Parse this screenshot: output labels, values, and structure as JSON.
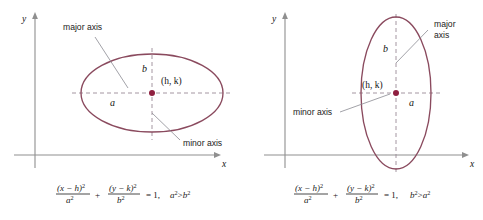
{
  "figure": {
    "stroke_color_curve": "#8a4a5e",
    "color_center_dot": "#8f2040",
    "color_axis": "#8f8f8f",
    "color_dash": "#9a8a96"
  },
  "panels": [
    {
      "id": "horizontal-major-axis",
      "orientation": "horizontal",
      "axis_x_label": "x",
      "axis_y_label": "y",
      "center_label": "(h, k)",
      "semi_axis_horizontal_label": "a",
      "semi_axis_vertical_label": "b",
      "annotation_major": "major axis",
      "annotation_major_line2": "",
      "annotation_minor": "minor axis",
      "annotation_minor_line2": "",
      "equation": {
        "num_left": "(x − h)",
        "num_left_exp": "2",
        "den_left": "a",
        "den_left_exp": "2",
        "plus": "+",
        "num_right": "(y − k)",
        "num_right_exp": "2",
        "den_right": "b",
        "den_right_exp": "2",
        "equals": "= 1,",
        "condition_left": "a",
        "condition_left_exp": "2",
        "condition_rel": ">",
        "condition_right": "b",
        "condition_right_exp": "2"
      }
    },
    {
      "id": "vertical-major-axis",
      "orientation": "vertical",
      "axis_x_label": "x",
      "axis_y_label": "y",
      "center_label": "(h, k)",
      "semi_axis_horizontal_label": "a",
      "semi_axis_vertical_label": "b",
      "annotation_major": "major",
      "annotation_major_line2": "axis",
      "annotation_minor": "minor axis",
      "annotation_minor_line2": "",
      "equation": {
        "num_left": "(x − h)",
        "num_left_exp": "2",
        "den_left": "a",
        "den_left_exp": "2",
        "plus": "+",
        "num_right": "(y − k)",
        "num_right_exp": "2",
        "den_right": "b",
        "den_right_exp": "2",
        "equals": "= 1,",
        "condition_left": "b",
        "condition_left_exp": "2",
        "condition_rel": ">",
        "condition_right": "a",
        "condition_right_exp": "2"
      }
    }
  ]
}
